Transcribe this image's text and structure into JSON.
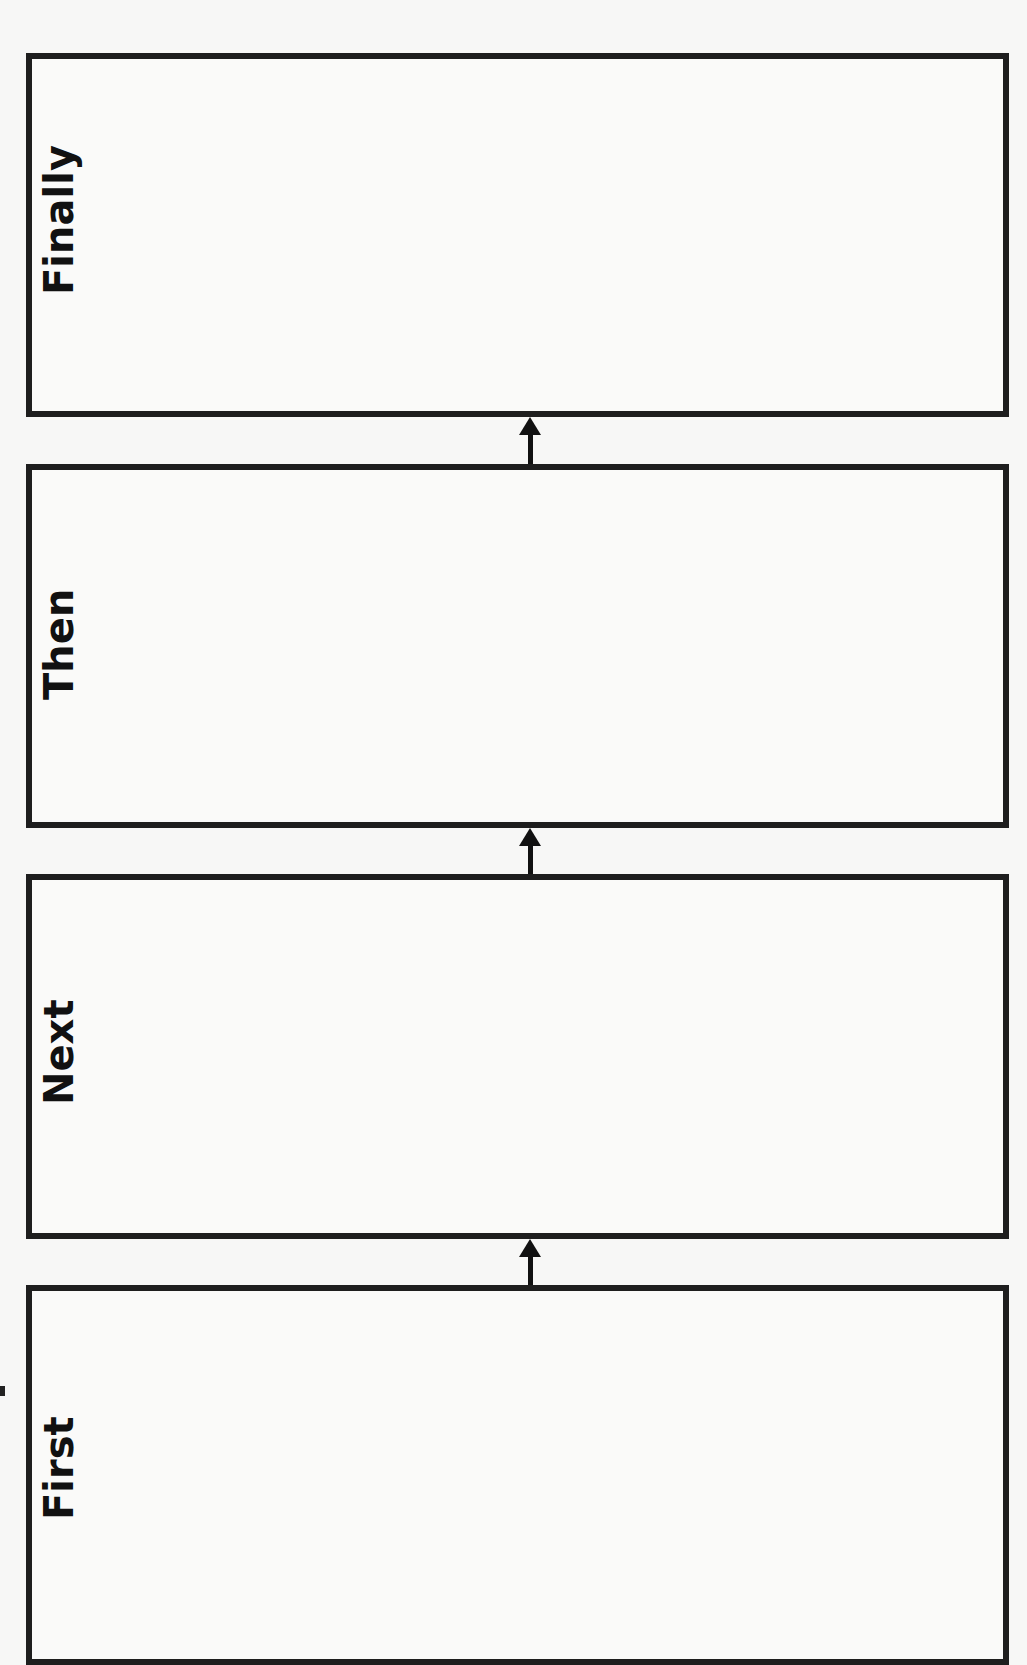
{
  "worksheet": {
    "title": "Sequence organizer",
    "boxes": [
      {
        "label": "Finally",
        "order": 4
      },
      {
        "label": "Then",
        "order": 3
      },
      {
        "label": "Next",
        "order": 2
      },
      {
        "label": "First",
        "order": 1
      }
    ],
    "arrows": [
      {
        "direction": "up",
        "from": "Then",
        "to": "Finally",
        "icon": "arrow-up-icon"
      },
      {
        "direction": "up",
        "from": "Next",
        "to": "Then",
        "icon": "arrow-up-icon"
      },
      {
        "direction": "up",
        "from": "First",
        "to": "Next",
        "icon": "arrow-up-icon"
      }
    ],
    "colors": {
      "border": "#1e1e1e",
      "paper": "#f7f7f6",
      "text": "#111111"
    }
  }
}
